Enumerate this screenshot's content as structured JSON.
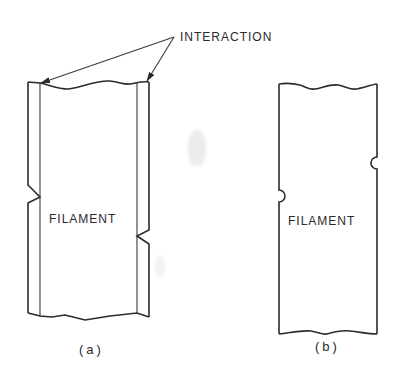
{
  "figure": {
    "annotation": "INTERACTION",
    "panels": [
      {
        "id": "a",
        "caption": "(a)",
        "label": "FILAMENT",
        "description": "Filament with double-walled sides; interaction sites shown as V-shaped notches"
      },
      {
        "id": "b",
        "caption": "(b)",
        "label": "FILAMENT",
        "description": "Filament with single-walled sides; interaction sites shown as semicircular indentations"
      }
    ]
  }
}
